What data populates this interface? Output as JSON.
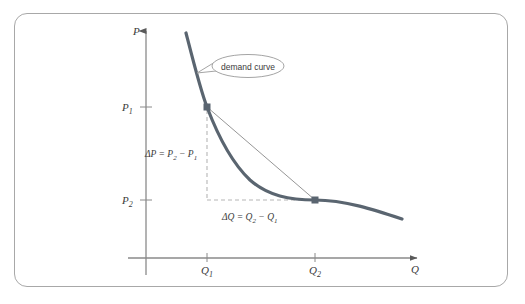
{
  "figure": {
    "background_color": "#ffffff",
    "border_color": "#a8a8a8"
  },
  "axes": {
    "y_axis_label": "P",
    "x_axis_label": "Q",
    "axis_color": "#8a8a8a",
    "origin": {
      "x": 146,
      "y": 258
    }
  },
  "ticks": {
    "y": [
      {
        "label": "P",
        "sub": "1",
        "value_y": 107
      },
      {
        "label": "P",
        "sub": "2",
        "value_y": 200
      }
    ],
    "x": [
      {
        "label": "Q",
        "sub": "1",
        "value_x": 207
      },
      {
        "label": "Q",
        "sub": "2",
        "value_x": 315
      }
    ]
  },
  "curve": {
    "name": "demand-curve",
    "color": "#5a6570",
    "width": 3.2,
    "start": {
      "x": 186,
      "y": 33
    },
    "end": {
      "x": 402,
      "y": 219
    }
  },
  "chord": {
    "name": "secant-line",
    "color": "#8a8a8a",
    "width": 0.9
  },
  "points": [
    {
      "name": "point-1",
      "x": 207,
      "y": 107,
      "color": "#5a6570"
    },
    {
      "name": "point-2",
      "x": 315,
      "y": 200,
      "color": "#5a6570"
    }
  ],
  "dashed_lines": {
    "color": "#b6b6b6",
    "vertical": {
      "x": 207,
      "y_top": 107,
      "y_bottom": 200
    },
    "horizontal": {
      "y": 200,
      "x_left": 207,
      "x_right": 315
    }
  },
  "annotations": {
    "delta_p": "ΔP = P₂ − P₁",
    "delta_q": "ΔQ = Q₂ − Q₁",
    "delta_p_parts": {
      "prefix": "ΔP = P",
      "sub1": "2",
      "mid": " − P",
      "sub2": "1"
    },
    "delta_q_parts": {
      "prefix": "ΔQ = Q",
      "sub1": "2",
      "mid": " − Q",
      "sub2": "1"
    }
  },
  "callout": {
    "text": "demand curve",
    "border_color": "#9a9a9a",
    "fill": "#ffffff",
    "center": {
      "x": 245,
      "y": 66
    },
    "pointer_to": {
      "x": 197,
      "y": 73
    }
  }
}
